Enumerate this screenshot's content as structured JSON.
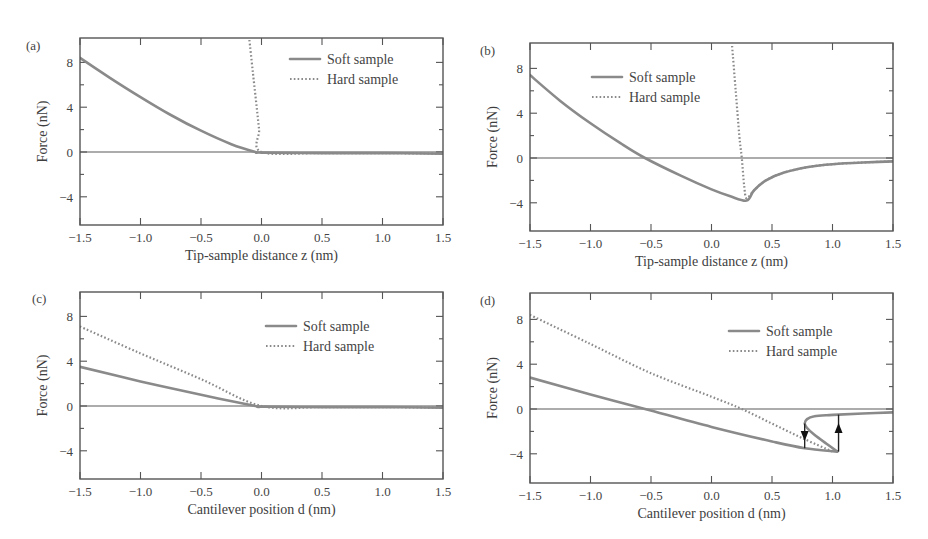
{
  "figure": {
    "legend": {
      "soft": "Soft sample",
      "hard": "Hard sample"
    },
    "y_axis_title": "Force (nN)",
    "y_ticks": [
      "8",
      "4",
      "0",
      "−4"
    ],
    "x_ticks": [
      "−1.5",
      "−1.0",
      "−0.5",
      "0.0",
      "0.5",
      "1.0",
      "1.5"
    ],
    "panels": [
      {
        "label": "(a)",
        "x_axis_title": "Tip-sample distance z (nm)"
      },
      {
        "label": "(b)",
        "x_axis_title": "Tip-sample distance z (nm)"
      },
      {
        "label": "(c)",
        "x_axis_title": "Cantilever position d (nm)"
      },
      {
        "label": "(d)",
        "x_axis_title": "Cantilever position d (nm)"
      }
    ]
  },
  "chart_data": [
    {
      "type": "line",
      "panel": "(a)",
      "title": "",
      "xlabel": "Tip-sample distance z (nm)",
      "ylabel": "Force (nN)",
      "xlim": [
        -1.5,
        1.5
      ],
      "ylim": [
        -6.5,
        10
      ],
      "x_ticks": [
        -1.5,
        -1.0,
        -0.5,
        0.0,
        0.5,
        1.0,
        1.5
      ],
      "y_ticks": [
        -4,
        0,
        4,
        8
      ],
      "grid": false,
      "legend_position": "upper right",
      "series": [
        {
          "name": "Soft sample",
          "style": "solid",
          "x": [
            -1.5,
            -1.25,
            -1.0,
            -0.75,
            -0.5,
            -0.25,
            -0.05,
            0.0,
            0.5,
            1.0,
            1.5
          ],
          "y": [
            8.4,
            6.6,
            4.9,
            3.3,
            1.9,
            0.7,
            0.0,
            -0.05,
            -0.1,
            -0.1,
            -0.15
          ]
        },
        {
          "name": "Hard sample",
          "style": "dotted",
          "x": [
            -0.1,
            -0.07,
            -0.04,
            -0.02,
            0.0,
            0.5,
            1.0,
            1.5
          ],
          "y": [
            10.0,
            7.0,
            4.0,
            2.0,
            0.0,
            -0.1,
            -0.1,
            -0.15
          ]
        }
      ]
    },
    {
      "type": "line",
      "panel": "(b)",
      "title": "",
      "xlabel": "Tip-sample distance z (nm)",
      "ylabel": "Force (nN)",
      "xlim": [
        -1.5,
        1.5
      ],
      "ylim": [
        -6.5,
        10
      ],
      "x_ticks": [
        -1.5,
        -1.0,
        -0.5,
        0.0,
        0.5,
        1.0,
        1.5
      ],
      "y_ticks": [
        -4,
        0,
        4,
        8
      ],
      "grid": false,
      "legend_position": "upper left",
      "series": [
        {
          "name": "Soft sample",
          "style": "solid",
          "x": [
            -1.5,
            -1.25,
            -1.0,
            -0.75,
            -0.55,
            -0.25,
            0.0,
            0.15,
            0.29,
            0.35,
            0.45,
            0.6,
            0.8,
            1.0,
            1.25,
            1.5
          ],
          "y": [
            7.4,
            5.1,
            3.1,
            1.3,
            0.0,
            -1.6,
            -2.8,
            -3.4,
            -3.8,
            -2.9,
            -2.0,
            -1.3,
            -0.8,
            -0.55,
            -0.4,
            -0.3
          ]
        },
        {
          "name": "Hard sample",
          "style": "dotted",
          "x": [
            0.17,
            0.2,
            0.23,
            0.25,
            0.27,
            0.29,
            0.35,
            0.45,
            0.6,
            0.8,
            1.0,
            1.25,
            1.5
          ],
          "y": [
            10.0,
            6.0,
            2.0,
            0.0,
            -2.5,
            -3.6,
            -2.9,
            -2.0,
            -1.3,
            -0.8,
            -0.55,
            -0.4,
            -0.3
          ]
        }
      ]
    },
    {
      "type": "line",
      "panel": "(c)",
      "title": "",
      "xlabel": "Cantilever position d (nm)",
      "ylabel": "Force (nN)",
      "xlim": [
        -1.5,
        1.5
      ],
      "ylim": [
        -6.5,
        10
      ],
      "x_ticks": [
        -1.5,
        -1.0,
        -0.5,
        0.0,
        0.5,
        1.0,
        1.5
      ],
      "y_ticks": [
        -4,
        0,
        4,
        8
      ],
      "grid": false,
      "legend_position": "upper right",
      "series": [
        {
          "name": "Soft sample",
          "style": "solid",
          "x": [
            -1.5,
            -1.0,
            -0.5,
            -0.05,
            0.0,
            0.5,
            1.0,
            1.5
          ],
          "y": [
            3.5,
            2.2,
            1.0,
            0.0,
            -0.05,
            -0.1,
            -0.1,
            -0.15
          ]
        },
        {
          "name": "Hard sample",
          "style": "dotted",
          "x": [
            -1.5,
            -1.0,
            -0.5,
            0.0,
            0.5,
            1.0,
            1.5
          ],
          "y": [
            7.1,
            4.7,
            2.4,
            0.0,
            -0.1,
            -0.1,
            -0.15
          ]
        }
      ]
    },
    {
      "type": "line",
      "panel": "(d)",
      "title": "",
      "xlabel": "Cantilever position d (nm)",
      "ylabel": "Force (nN)",
      "xlim": [
        -1.5,
        1.5
      ],
      "ylim": [
        -6.5,
        10
      ],
      "x_ticks": [
        -1.5,
        -1.0,
        -0.5,
        0.0,
        0.5,
        1.0,
        1.5
      ],
      "y_ticks": [
        -4,
        0,
        4,
        8
      ],
      "grid": false,
      "legend_position": "upper right",
      "annotations": [
        {
          "type": "arrow",
          "direction": "down",
          "x": 0.77,
          "from_y": -1.3,
          "to_y": -3.5,
          "note": "snap-in"
        },
        {
          "type": "arrow",
          "direction": "up",
          "x": 1.05,
          "from_y": -3.8,
          "to_y": -0.5,
          "note": "pull-off"
        }
      ],
      "series": [
        {
          "name": "Soft sample",
          "style": "solid",
          "x": [
            -1.5,
            -1.0,
            -0.55,
            0.0,
            0.5,
            0.77,
            1.04
          ],
          "y": [
            2.8,
            1.3,
            0.0,
            -1.6,
            -2.9,
            -3.5,
            -3.8
          ],
          "upper_branch": {
            "x": [
              1.04,
              0.95,
              0.85,
              0.79,
              0.77,
              0.79,
              0.85,
              0.95,
              1.05,
              1.25,
              1.5
            ],
            "y": [
              -3.8,
              -3.1,
              -2.3,
              -1.7,
              -1.3,
              -0.9,
              -0.65,
              -0.55,
              -0.5,
              -0.4,
              -0.3
            ]
          }
        },
        {
          "name": "Hard sample",
          "style": "dotted",
          "x": [
            -1.5,
            -1.0,
            -0.5,
            0.0,
            0.25,
            0.5,
            0.75,
            1.0
          ],
          "y": [
            8.4,
            5.8,
            3.2,
            1.1,
            0.0,
            -1.3,
            -2.6,
            -3.8
          ]
        }
      ]
    }
  ]
}
